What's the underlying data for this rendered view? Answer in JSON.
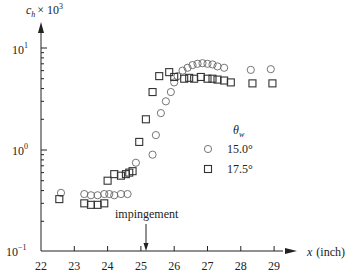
{
  "chart_data": {
    "type": "scatter",
    "title": "",
    "xlabel": "x (inch)",
    "ylabel": "c_h × 10^3",
    "xlim": [
      22,
      29.5
    ],
    "ylim": [
      0.1,
      10
    ],
    "yscale": "log",
    "grid": false,
    "x_ticks": [
      "22",
      "23",
      "24",
      "25",
      "26",
      "27",
      "28",
      "29"
    ],
    "y_ticks": [
      "10^-1",
      "10^0",
      "10^1"
    ],
    "legend": {
      "title": "θ_w",
      "position": "center-right",
      "entries": [
        {
          "label": "15.0°",
          "marker": "circle"
        },
        {
          "label": "17.5°",
          "marker": "square"
        }
      ]
    },
    "annotations": [
      {
        "text": "impingement",
        "x": 25.2,
        "arrow_to": "x-axis"
      }
    ],
    "series": [
      {
        "name": "15.0°",
        "marker": "circle",
        "x": [
          22.6,
          23.3,
          23.5,
          23.7,
          23.9,
          24.05,
          24.2,
          24.4,
          24.6,
          24.85,
          25.35,
          25.45,
          25.6,
          25.75,
          25.9,
          26.0,
          26.1,
          26.25,
          26.4,
          26.55,
          26.7,
          26.85,
          27.0,
          27.15,
          27.3,
          27.5,
          28.3,
          28.9
        ],
        "y": [
          0.38,
          0.37,
          0.36,
          0.36,
          0.37,
          0.37,
          0.36,
          0.37,
          0.37,
          0.75,
          0.9,
          1.4,
          2.3,
          3.0,
          3.7,
          4.6,
          5.3,
          6.0,
          6.4,
          6.8,
          7.0,
          7.1,
          7.0,
          6.9,
          6.6,
          6.4,
          6.1,
          6.2
        ]
      },
      {
        "name": "17.5°",
        "marker": "square",
        "x": [
          22.55,
          23.3,
          23.5,
          23.7,
          23.9,
          24.0,
          24.2,
          24.4,
          24.55,
          24.65,
          24.75,
          24.95,
          25.15,
          25.35,
          25.55,
          25.85,
          26.0,
          26.3,
          26.45,
          26.6,
          26.8,
          27.0,
          27.15,
          27.3,
          27.5,
          27.7,
          28.35,
          28.95
        ],
        "y": [
          0.33,
          0.3,
          0.29,
          0.29,
          0.3,
          0.5,
          0.58,
          0.56,
          0.58,
          0.6,
          0.62,
          1.2,
          2.0,
          3.7,
          5.3,
          5.8,
          5.2,
          5.0,
          5.1,
          5.0,
          5.2,
          5.0,
          5.0,
          4.9,
          4.8,
          4.6,
          4.5,
          4.5
        ]
      }
    ]
  },
  "axes": {
    "x_label_var": "x",
    "x_label_unit": "(inch)",
    "y_label_var": "c",
    "y_label_sub": "h",
    "y_label_times": "× 10",
    "y_label_exp": "3",
    "y_ticks": [
      {
        "base": "10",
        "exp": "1"
      },
      {
        "base": "10",
        "exp": "0"
      },
      {
        "base": "10",
        "exp": "−1"
      }
    ],
    "x_ticks": [
      "22",
      "23",
      "24",
      "25",
      "26",
      "27",
      "28",
      "29"
    ]
  },
  "legend": {
    "title_var": "θ",
    "title_sub": "w",
    "entries": [
      {
        "label": "15.0°"
      },
      {
        "label": "17.5°"
      }
    ]
  },
  "annotation": {
    "text": "impingement"
  }
}
